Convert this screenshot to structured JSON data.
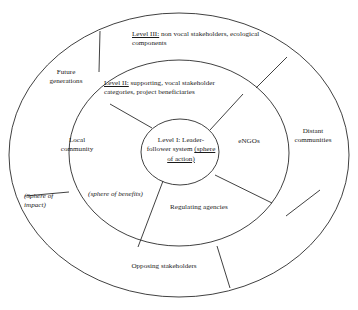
{
  "diagram": {
    "style": {
      "stroke": "#2b2b2b",
      "background": "#ffffff",
      "text_color": "#1a1a1a"
    },
    "levels": {
      "level1": {
        "prefix": "Level I: ",
        "text": "Leader-follower system ",
        "emphasis": "(sphere of action)",
        "full": "Level I: Leader-follower system (sphere of action)"
      },
      "level2": {
        "prefix": "Level II:",
        "text": " supporting, vocal stakeholder categories, project beneficiaries",
        "full": "Level II: supporting, vocal stakeholder categories, project beneficiaries"
      },
      "level3": {
        "prefix": "Level III:",
        "text": " non vocal stakeholders, ecological components",
        "full": "Level III: non vocal stakeholders, ecological components"
      }
    },
    "spheres": {
      "benefits": "(sphere of benefits)",
      "impact": "(Sphere of\nimpact)"
    },
    "inner_ring_segments": [
      {
        "id": "local-community",
        "label": "Local\ncommunity"
      },
      {
        "id": "engos",
        "label": "eNGOs"
      },
      {
        "id": "regulating-agencies",
        "label": "Regulating agencies"
      }
    ],
    "outer_ring_segments": [
      {
        "id": "future-generations",
        "label": "Future\ngenerations"
      },
      {
        "id": "distant-communities",
        "label": "Distant\ncommunities"
      },
      {
        "id": "opposing-stakeholders",
        "label": "Opposing stakeholders"
      }
    ]
  }
}
